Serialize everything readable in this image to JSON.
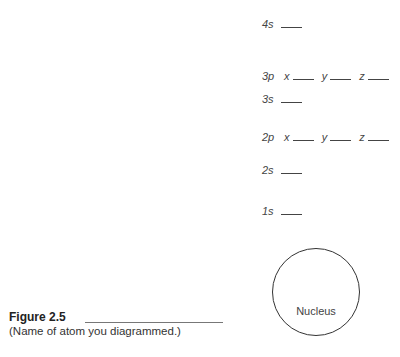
{
  "orbitals": [
    {
      "label": "4s",
      "top": 17
    },
    {
      "label": "3p",
      "top": 69,
      "subs": [
        "x",
        "y",
        "z"
      ]
    },
    {
      "label": "3s",
      "top": 92
    },
    {
      "label": "2p",
      "top": 130,
      "subs": [
        "x",
        "y",
        "z"
      ]
    },
    {
      "label": "2s",
      "top": 163
    },
    {
      "label": "1s",
      "top": 204
    }
  ],
  "nucleus_label": "Nucleus",
  "figure": {
    "title": "Figure 2.5",
    "caption": "(Name of atom you diagrammed.)"
  }
}
